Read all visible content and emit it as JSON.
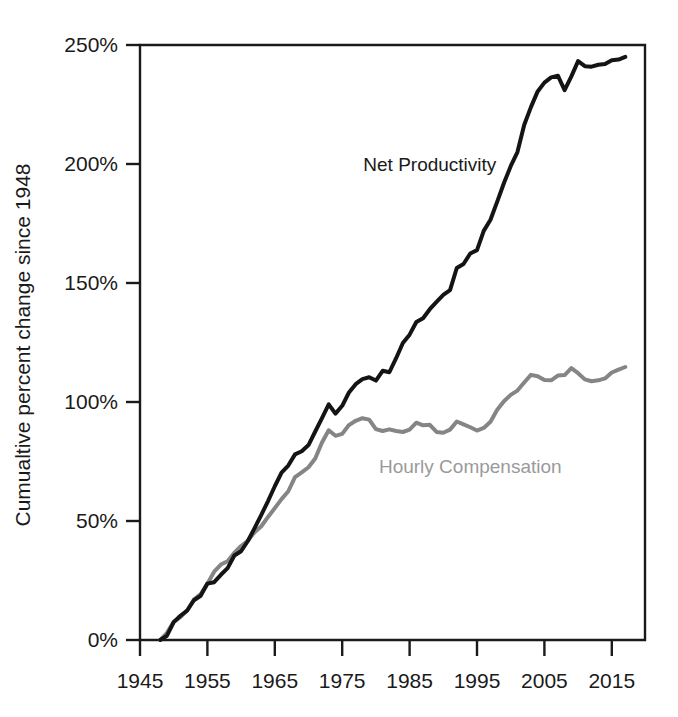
{
  "chart_data": {
    "type": "line",
    "title": "",
    "subtitle": "",
    "xlabel": "",
    "ylabel": "Cumualtive percent change since 1948",
    "xlim": [
      1945,
      2017
    ],
    "ylim": [
      0,
      250
    ],
    "grid": false,
    "legend_position": "inline-annotation",
    "x_tick_labels": [
      "1945",
      "1955",
      "1965",
      "1975",
      "1985",
      "1995",
      "2005",
      "2015"
    ],
    "x_ticks": [
      1945,
      1955,
      1965,
      1975,
      1985,
      1995,
      2005,
      2015
    ],
    "y_tick_labels": [
      "0%",
      "50%",
      "100%",
      "150%",
      "200%",
      "250%"
    ],
    "y_ticks": [
      0,
      50,
      100,
      150,
      200,
      250
    ],
    "annotations": [
      {
        "name": "net-productivity-label",
        "text": "Net Productivity",
        "x": 1988,
        "y": 197,
        "color": "#1a1a1a"
      },
      {
        "name": "hourly-compensation-label",
        "text": "Hourly Compensation",
        "x": 1994,
        "y": 70,
        "color": "#9a9a9a"
      }
    ],
    "x": [
      1948,
      1949,
      1950,
      1951,
      1952,
      1953,
      1954,
      1955,
      1956,
      1957,
      1958,
      1959,
      1960,
      1961,
      1962,
      1963,
      1964,
      1965,
      1966,
      1967,
      1968,
      1969,
      1970,
      1971,
      1972,
      1973,
      1974,
      1975,
      1976,
      1977,
      1978,
      1979,
      1980,
      1981,
      1982,
      1983,
      1984,
      1985,
      1986,
      1987,
      1988,
      1989,
      1990,
      1991,
      1992,
      1993,
      1994,
      1995,
      1996,
      1997,
      1998,
      1999,
      2000,
      2001,
      2002,
      2003,
      2004,
      2005,
      2006,
      2007,
      2008,
      2009,
      2010,
      2011,
      2012,
      2013,
      2014,
      2015,
      2016,
      2017
    ],
    "series": [
      {
        "name": "Net Productivity",
        "color": "#141414",
        "linewidth": 4,
        "values": [
          0,
          1.8,
          7.5,
          10.2,
          12.4,
          16.7,
          18.6,
          23.7,
          24.3,
          27.4,
          30.2,
          35.5,
          37.3,
          41.6,
          47.0,
          52.6,
          58.4,
          64.6,
          70.3,
          73.3,
          78.0,
          79.3,
          81.9,
          87.6,
          93.2,
          99.0,
          95.1,
          98.4,
          104.0,
          107.5,
          109.6,
          110.4,
          109.0,
          113.1,
          112.5,
          118.4,
          124.8,
          128.3,
          133.6,
          135.2,
          139.0,
          142.1,
          145.0,
          147.0,
          156.3,
          158.0,
          162.4,
          163.8,
          171.9,
          176.6,
          184.2,
          192.0,
          199.1,
          205.0,
          216.4,
          223.9,
          230.5,
          234.2,
          236.4,
          237.1,
          231.0,
          236.8,
          243.2,
          241.1,
          240.9,
          241.7,
          242.0,
          243.6,
          243.9,
          245.0
        ]
      },
      {
        "name": "Hourly Compensation",
        "color": "#858585",
        "linewidth": 4,
        "values": [
          0,
          3.0,
          7.6,
          9.6,
          12.4,
          17.0,
          19.3,
          23.6,
          28.7,
          31.7,
          33.1,
          36.7,
          39.5,
          41.7,
          45.3,
          47.8,
          51.7,
          55.4,
          59.2,
          62.5,
          68.4,
          70.4,
          72.6,
          76.3,
          83.0,
          88.1,
          85.8,
          86.6,
          90.3,
          92.1,
          93.2,
          92.6,
          88.6,
          87.8,
          88.5,
          87.8,
          87.4,
          88.4,
          91.3,
          90.2,
          90.4,
          87.4,
          87.1,
          88.4,
          91.8,
          90.6,
          89.4,
          88.0,
          89.1,
          91.7,
          96.7,
          100.3,
          103.0,
          104.8,
          108.2,
          111.4,
          110.8,
          109.2,
          109.1,
          111.1,
          111.3,
          114.2,
          112.1,
          109.5,
          108.7,
          109.1,
          109.9,
          112.4,
          113.6,
          114.7
        ]
      }
    ]
  },
  "axis": {
    "y_axis_title": "Cumualtive percent change since 1948"
  }
}
